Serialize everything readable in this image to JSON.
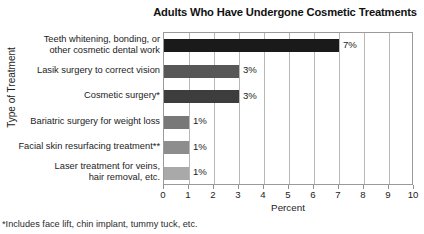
{
  "chart_data": {
    "type": "bar",
    "orientation": "horizontal",
    "title": "Adults Who Have Undergone Cosmetic Treatments",
    "xlabel": "Percent",
    "ylabel": "Type of Treatment",
    "xlim": [
      0,
      10
    ],
    "xticks": [
      "0",
      "1",
      "2",
      "3",
      "4",
      "5",
      "6",
      "7",
      "8",
      "9",
      "10"
    ],
    "grid": "vertical",
    "legend": "none",
    "categories": [
      "Teeth whitening, bonding, or\nother cosmetic dental work",
      "Lasik surgery to correct vision",
      "Cosmetic surgery*",
      "Bariatric surgery for weight loss",
      "Facial skin resurfacing treatment**",
      "Laser treatment for veins,\nhair removal, etc."
    ],
    "values": [
      7,
      3,
      3,
      1,
      1,
      1
    ],
    "value_labels": [
      "7%",
      "3%",
      "3%",
      "1%",
      "1%",
      "1%"
    ],
    "bar_colors": [
      "#1a1a1a",
      "#575757",
      "#3d3d3d",
      "#787878",
      "#8d8d8d",
      "#a9a9a9"
    ],
    "footnotes": [
      "*Includes face lift, chin implant, tummy tuck, etc."
    ]
  },
  "axis_colors": {
    "frame": "#9a9a9a",
    "grid": "#b8b8b8",
    "text": "#1c1c1c"
  }
}
